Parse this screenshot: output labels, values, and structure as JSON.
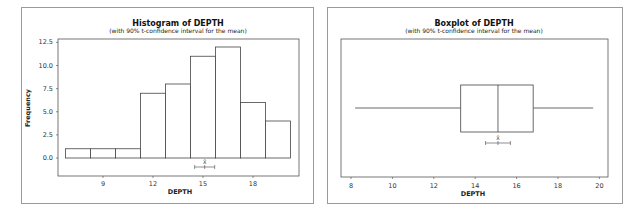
{
  "chart_data": [
    {
      "type": "bar",
      "subtype": "histogram",
      "title": "Histogram of DEPTH",
      "subtitle": "(with 90% t-confidence interval for the mean)",
      "xlabel": "DEPTH",
      "ylabel": "Frequency",
      "bins": [
        {
          "start": 6.75,
          "end": 8.25,
          "count": 1
        },
        {
          "start": 8.25,
          "end": 9.75,
          "count": 1
        },
        {
          "start": 9.75,
          "end": 11.25,
          "count": 1
        },
        {
          "start": 11.25,
          "end": 12.75,
          "count": 7
        },
        {
          "start": 12.75,
          "end": 14.25,
          "count": 8
        },
        {
          "start": 14.25,
          "end": 15.75,
          "count": 11
        },
        {
          "start": 15.75,
          "end": 17.25,
          "count": 12
        },
        {
          "start": 17.25,
          "end": 18.75,
          "count": 6
        },
        {
          "start": 18.75,
          "end": 20.25,
          "count": 4
        }
      ],
      "x_ticks": [
        9,
        12,
        15,
        18
      ],
      "x_tick_labels": [
        "9",
        "12",
        "15",
        "18"
      ],
      "y_ticks": [
        0,
        2.5,
        5,
        7.5,
        10,
        12.5
      ],
      "y_tick_labels": [
        "0.0",
        "2.5",
        "5.0",
        "7.5",
        "10.0",
        "12.5"
      ],
      "ylim": [
        -2.2,
        13.2
      ],
      "confidence_interval": {
        "label": "X̄",
        "mean": 15.1,
        "lower": 14.5,
        "upper": 15.7,
        "level": "90%"
      },
      "grid": false,
      "legend": "none"
    },
    {
      "type": "boxplot",
      "title": "Boxplot of DEPTH",
      "subtitle": "(with 90% t-confidence interval for the mean)",
      "xlabel": "DEPTH",
      "orientation": "horizontal",
      "min": 8.2,
      "q1": 13.3,
      "median": 15.1,
      "q3": 16.8,
      "max": 19.7,
      "x_ticks": [
        8,
        10,
        12,
        14,
        16,
        18,
        20
      ],
      "x_tick_labels": [
        "8",
        "10",
        "12",
        "14",
        "16",
        "18",
        "20"
      ],
      "xlim": [
        7.5,
        20.5
      ],
      "confidence_interval": {
        "label": "X̄",
        "mean": 15.1,
        "lower": 14.5,
        "upper": 15.7,
        "level": "90%"
      },
      "grid": false,
      "legend": "none"
    }
  ]
}
